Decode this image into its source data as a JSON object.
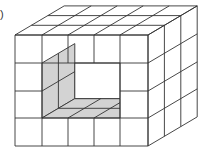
{
  "figure": {
    "label": ")",
    "grid": {
      "columns": 5,
      "rows": 4,
      "depth": 3
    },
    "hole": {
      "col_start": 1,
      "col_end": 3,
      "row_start": 1,
      "row_end": 2
    },
    "colors": {
      "line": "#333333",
      "shade": "#d3d3d3",
      "background": "#ffffff"
    }
  }
}
